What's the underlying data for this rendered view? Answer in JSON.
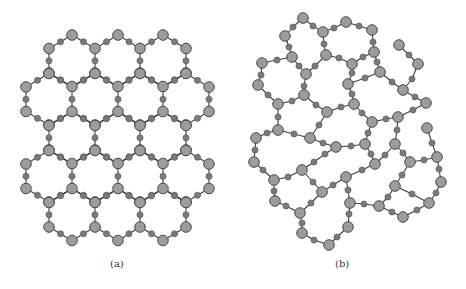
{
  "figure": {
    "panels": [
      {
        "id": "a",
        "caption": "(a)",
        "description": "regular honeycomb lattice",
        "lattice": {
          "rows": [
            3,
            4,
            3,
            4,
            3
          ],
          "x_columns": [
            26,
            49,
            72,
            95,
            118,
            140,
            163,
            186,
            209
          ],
          "row_tops": [
            35,
            73.5,
            112,
            150.5,
            189
          ],
          "radius": 25.5
        }
      },
      {
        "id": "b",
        "caption": "(b)",
        "description": "disordered network",
        "nodes": {
          "L1": [
            303,
            18
          ],
          "L2": [
            285,
            36
          ],
          "L3": [
            292,
            57
          ],
          "L4": [
            262,
            63
          ],
          "L5": [
            306,
            74
          ],
          "L6": [
            258,
            85
          ],
          "L7": [
            304,
            95
          ],
          "L8": [
            323,
            32
          ],
          "L9": [
            346,
            22
          ],
          "L10": [
            372,
            30
          ],
          "L11": [
            374,
            52
          ],
          "L12": [
            326,
            55
          ],
          "L13": [
            352,
            64
          ],
          "L14": [
            380,
            72
          ],
          "L15": [
            348,
            84
          ],
          "L16": [
            399,
            45
          ],
          "L17": [
            418,
            64
          ],
          "L18": [
            403,
            90
          ],
          "L20": [
            426,
            103
          ],
          "L21": [
            398,
            117
          ],
          "L22": [
            372,
            122
          ],
          "L23": [
            354,
            104
          ],
          "L24": [
            327,
            112
          ],
          "L25": [
            278,
            104
          ],
          "L26": [
            278,
            130
          ],
          "L27": [
            256,
            138
          ],
          "L28": [
            310,
            138
          ],
          "L29": [
            254,
            162
          ],
          "L30": [
            274,
            180
          ],
          "L31": [
            302,
            170
          ],
          "L32": [
            336,
            147
          ],
          "L33": [
            365,
            144
          ],
          "L34": [
            395,
            144
          ],
          "L35": [
            375,
            164
          ],
          "L36": [
            410,
            162
          ],
          "L37": [
            437,
            157
          ],
          "L38": [
            427,
            128
          ],
          "L39": [
            441,
            182
          ],
          "L40": [
            429,
            203
          ],
          "L41": [
            403,
            217
          ],
          "L42": [
            379,
            206
          ],
          "L43": [
            395,
            186
          ],
          "L44": [
            346,
            177
          ],
          "L45": [
            350,
            203
          ],
          "L46": [
            348,
            227
          ],
          "L47": [
            329,
            245
          ],
          "L48": [
            302,
            233
          ],
          "L49": [
            300,
            213
          ],
          "L50": [
            322,
            192
          ],
          "L51": [
            275,
            201
          ]
        },
        "edges": [
          [
            "L2",
            "L1",
            [
              [
                293,
                27
              ]
            ]
          ],
          [
            "L1",
            "L8",
            [
              [
                313,
                26
              ]
            ]
          ],
          [
            "L2",
            "L3",
            [
              [
                289,
                47
              ]
            ]
          ],
          [
            "L3",
            "L4",
            [
              [
                277,
                60
              ]
            ]
          ],
          [
            "L3",
            "L5",
            [
              [
                299,
                66
              ]
            ]
          ],
          [
            "L5",
            "L12",
            [
              [
                315,
                66
              ]
            ]
          ],
          [
            "L4",
            "L6",
            [
              [
                261,
                75
              ]
            ]
          ],
          [
            "L5",
            "L7",
            [
              [
                304,
                86
              ]
            ]
          ],
          [
            "L8",
            "L9",
            [
              [
                334,
                28
              ]
            ]
          ],
          [
            "L9",
            "L10",
            [
              [
                359,
                26
              ]
            ]
          ],
          [
            "L10",
            "L11",
            [
              [
                373,
                42
              ]
            ]
          ],
          [
            "L8",
            "L12",
            [
              [
                324,
                44
              ]
            ]
          ],
          [
            "L12",
            "L13",
            [
              [
                339,
                58
              ]
            ]
          ],
          [
            "L13",
            "L11",
            [
              [
                363,
                57
              ]
            ]
          ],
          [
            "L11",
            "L14",
            [
              [
                377,
                62
              ]
            ]
          ],
          [
            "L13",
            "L15",
            [
              [
                352,
                73
              ]
            ]
          ],
          [
            "L14",
            "L15",
            [
              [
                365,
                78
              ]
            ]
          ],
          [
            "L14",
            "L18",
            [
              [
                392,
                82
              ]
            ]
          ],
          [
            "L16",
            "L17",
            [
              [
                409,
                55
              ]
            ]
          ],
          [
            "L17",
            "L18",
            [
              [
                412,
                79
              ]
            ]
          ],
          [
            "L18",
            "L20",
            [
              [
                415,
                97
              ]
            ]
          ],
          [
            "L20",
            "L21",
            [
              [
                413,
                110
              ]
            ]
          ],
          [
            "L21",
            "L22",
            [
              [
                386,
                119
              ]
            ]
          ],
          [
            "L15",
            "L23",
            [
              [
                352,
                94
              ]
            ]
          ],
          [
            "L23",
            "L24",
            [
              [
                341,
                107
              ]
            ]
          ],
          [
            "L23",
            "L22",
            [
              [
                362,
                113
              ]
            ]
          ],
          [
            "L22",
            "L33",
            [
              [
                368,
                133
              ]
            ]
          ],
          [
            "L21",
            "L34",
            [
              [
                397,
                130
              ]
            ]
          ],
          [
            "L7",
            "L24",
            [
              [
                316,
                105
              ]
            ]
          ],
          [
            "L24",
            "L28",
            [
              [
                319,
                125
              ]
            ]
          ],
          [
            "L7",
            "L25",
            [
              [
                292,
                101
              ]
            ]
          ],
          [
            "L6",
            "L25",
            [
              [
                268,
                95
              ]
            ]
          ],
          [
            "L25",
            "L26",
            [
              [
                278,
                117
              ]
            ]
          ],
          [
            "L26",
            "L27",
            [
              [
                267,
                133
              ]
            ]
          ],
          [
            "L26",
            "L28",
            [
              [
                294,
                134
              ]
            ]
          ],
          [
            "L28",
            "L32",
            [
              [
                323,
                143
              ]
            ]
          ],
          [
            "L32",
            "L33",
            [
              [
                351,
                146
              ]
            ]
          ],
          [
            "L32",
            "L31",
            [
              [
                325,
                154
              ],
              [
                314,
                162
              ]
            ]
          ],
          [
            "L27",
            "L29",
            [
              [
                255,
                150
              ]
            ]
          ],
          [
            "L29",
            "L30",
            [
              [
                263,
                170
              ]
            ]
          ],
          [
            "L30",
            "L31",
            [
              [
                288,
                177
              ]
            ]
          ],
          [
            "L30",
            "L51",
            [
              [
                274,
                191
              ]
            ]
          ],
          [
            "L51",
            "L49",
            [
              [
                286,
                206
              ]
            ]
          ],
          [
            "L49",
            "L50",
            [
              [
                311,
                203
              ]
            ]
          ],
          [
            "L50",
            "L44",
            [
              [
                333,
                185
              ]
            ]
          ],
          [
            "L31",
            "L50",
            [
              [
                313,
                182
              ]
            ]
          ],
          [
            "L44",
            "L35",
            [
              [
                362,
                170
              ]
            ]
          ],
          [
            "L35",
            "L33",
            [
              [
                371,
                154
              ]
            ]
          ],
          [
            "L35",
            "L34",
            [
              [
                385,
                155
              ]
            ]
          ],
          [
            "L34",
            "L36",
            [
              [
                403,
                153
              ]
            ]
          ],
          [
            "L36",
            "L37",
            [
              [
                424,
                160
              ]
            ]
          ],
          [
            "L37",
            "L38",
            [
              [
                432,
                143
              ]
            ]
          ],
          [
            "L37",
            "L39",
            [
              [
                439,
                169
              ]
            ]
          ],
          [
            "L39",
            "L40",
            [
              [
                436,
                193
              ]
            ]
          ],
          [
            "L40",
            "L41",
            [
              [
                417,
                210
              ]
            ]
          ],
          [
            "L41",
            "L42",
            [
              [
                392,
                212
              ]
            ]
          ],
          [
            "L42",
            "L43",
            [
              [
                388,
                197
              ]
            ]
          ],
          [
            "L43",
            "L36",
            [
              [
                402,
                175
              ]
            ]
          ],
          [
            "L43",
            "L40",
            [
              [
                412,
                194
              ]
            ]
          ],
          [
            "L42",
            "L45",
            [
              [
                364,
                204
              ]
            ]
          ],
          [
            "L45",
            "L44",
            [
              [
                348,
                190
              ]
            ]
          ],
          [
            "L45",
            "L46",
            [
              [
                349,
                214
              ]
            ]
          ],
          [
            "L46",
            "L47",
            [
              [
                337,
                237
              ]
            ]
          ],
          [
            "L47",
            "L48",
            [
              [
                314,
                240
              ]
            ]
          ],
          [
            "L48",
            "L49",
            [
              [
                302,
                223
              ]
            ]
          ]
        ]
      }
    ],
    "colors": {
      "big_node_fill": "#9c9c9c",
      "small_node_fill": "#7a7a7a",
      "edge": "#3c3c3c",
      "background": "#ffffff"
    }
  }
}
